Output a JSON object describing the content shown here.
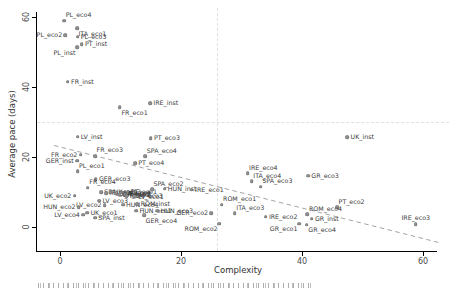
{
  "figure": {
    "reference_lines": {
      "horizontal_y": 30,
      "vertical_x": 25.9
    },
    "trend_line": {
      "x1": -1,
      "y1": 23.3,
      "x2": 63,
      "y2": -4.6
    },
    "colors": {
      "point": "#8f8f8f",
      "point_edge": "#6f6f6f",
      "trend_line": "#999999",
      "reference_line": "#e0e0e0",
      "axis": "#000000",
      "tick_label": "#4a4a4a",
      "point_label": "#3a3a3a"
    }
  },
  "chart_data": {
    "type": "scatter",
    "title": "",
    "xlabel": "Complexity",
    "ylabel": "Average pace (days)",
    "xlim": [
      -4,
      64
    ],
    "ylim": [
      -7,
      62
    ],
    "x_ticks": [
      0,
      20,
      40,
      60
    ],
    "y_ticks": [
      0,
      20,
      40,
      60
    ],
    "grid": "reference lines only (dashed at x=25.9, y=30)",
    "legend": "none",
    "trend": "dashed negative linear fit from (0,23) to (63,-4.6)",
    "points": [
      {
        "label": "PL_eco4",
        "x": 0.7,
        "y": 59.0,
        "side": "above-right"
      },
      {
        "label": "ITA_eco1",
        "x": 2.8,
        "y": 56.8,
        "side": "below-right"
      },
      {
        "label": "PL_eco2",
        "x": 0.9,
        "y": 54.8,
        "side": "left"
      },
      {
        "label": "PL_eco3",
        "x": 2.9,
        "y": 54.4,
        "side": "right"
      },
      {
        "label": "PT_inst",
        "x": 3.6,
        "y": 52.3,
        "side": "right"
      },
      {
        "label": "PL_inst",
        "x": 2.8,
        "y": 51.3,
        "side": "below-left"
      },
      {
        "label": "FR_inst",
        "x": 1.3,
        "y": 41.5,
        "side": "right"
      },
      {
        "label": "IRE_inst",
        "x": 14.9,
        "y": 35.4,
        "side": "right"
      },
      {
        "label": "FR_eco1",
        "x": 9.9,
        "y": 34.2,
        "side": "below-right"
      },
      {
        "label": "LV_inst",
        "x": 2.9,
        "y": 25.8,
        "side": "right"
      },
      {
        "label": "PT_eco3",
        "x": 15.0,
        "y": 25.4,
        "side": "right"
      },
      {
        "label": "UK_inst",
        "x": 47.5,
        "y": 25.6,
        "side": "right"
      },
      {
        "label": "FR_eco2",
        "x": 3.4,
        "y": 20.6,
        "side": "left"
      },
      {
        "label": "FR_eco3",
        "x": 5.8,
        "y": 20.3,
        "side": "above-right"
      },
      {
        "label": "GER_inst",
        "x": 2.8,
        "y": 19.0,
        "side": "left"
      },
      {
        "label": "PL_eco1",
        "x": 2.9,
        "y": 16.0,
        "side": "above-right"
      },
      {
        "label": "GER_eco3",
        "x": 5.9,
        "y": 13.6,
        "side": "right"
      },
      {
        "label": "SPA_eco4",
        "x": 14.1,
        "y": 20.2,
        "side": "above-right"
      },
      {
        "label": "PT_eco4",
        "x": 12.4,
        "y": 18.2,
        "side": "right"
      },
      {
        "label": "FR_eco4",
        "x": 4.6,
        "y": 11.2,
        "side": "above-right"
      },
      {
        "label": "UK_eco2",
        "x": 2.4,
        "y": 8.9,
        "side": "left"
      },
      {
        "label": "SPA_eco1",
        "x": 6.8,
        "y": 9.9,
        "side": "right"
      },
      {
        "label": "ITA_eco2",
        "x": 7.6,
        "y": 9.6,
        "side": "right"
      },
      {
        "label": "UK_eco3",
        "x": 8.4,
        "y": 9.9,
        "side": "right"
      },
      {
        "label": "GER_eco1",
        "x": 9.2,
        "y": 9.5,
        "side": "right"
      },
      {
        "label": "UK_eco4",
        "x": 10.0,
        "y": 9.8,
        "side": "right"
      },
      {
        "label": "ITA_inst",
        "x": 10.6,
        "y": 9.4,
        "side": "right"
      },
      {
        "label": "PT_eco1",
        "x": 11.2,
        "y": 9.9,
        "side": "right"
      },
      {
        "label": "GR_eco2",
        "x": 9.8,
        "y": 9.2,
        "side": "right"
      },
      {
        "label": "ROM_eco3",
        "x": 11.0,
        "y": 8.8,
        "side": "right"
      },
      {
        "label": "LV_eco3",
        "x": 6.5,
        "y": 7.5,
        "side": "right"
      },
      {
        "label": "SPA_eco2",
        "x": 15.2,
        "y": 10.8,
        "side": "above-right"
      },
      {
        "label": "HUN_inst",
        "x": 17.3,
        "y": 10.9,
        "side": "right"
      },
      {
        "label": "IRE_eco1",
        "x": 21.8,
        "y": 10.6,
        "side": "right"
      },
      {
        "label": "LV_eco2",
        "x": 7.4,
        "y": 6.2,
        "side": "left"
      },
      {
        "label": "HUN_eco4",
        "x": 10.4,
        "y": 6.4,
        "side": "right"
      },
      {
        "label": "LV_eco1",
        "x": 12.4,
        "y": 8.6,
        "side": "right"
      },
      {
        "label": "ROM_inst",
        "x": 12.8,
        "y": 6.5,
        "side": "right"
      },
      {
        "label": "HUN_eco2",
        "x": 3.1,
        "y": 5.7,
        "side": "left"
      },
      {
        "label": "LV_eco4",
        "x": 3.8,
        "y": 3.5,
        "side": "left"
      },
      {
        "label": "UK_eco1",
        "x": 4.5,
        "y": 4.1,
        "side": "right"
      },
      {
        "label": "SPA_inst",
        "x": 5.8,
        "y": 2.6,
        "side": "right"
      },
      {
        "label": "HUN_eco1",
        "x": 12.6,
        "y": 4.6,
        "side": "right"
      },
      {
        "label": "HUN_eco3",
        "x": 16.1,
        "y": 4.7,
        "side": "right"
      },
      {
        "label": "GER_eco4",
        "x": 13.9,
        "y": 3.4,
        "side": "below-right"
      },
      {
        "label": "IRE_eco4",
        "x": 31.0,
        "y": 15.3,
        "side": "above-right"
      },
      {
        "label": "ITA_eco4",
        "x": 31.7,
        "y": 13.1,
        "side": "above-right"
      },
      {
        "label": "SPA_eco3",
        "x": 33.2,
        "y": 11.5,
        "side": "above-right"
      },
      {
        "label": "GR_eco3",
        "x": 41.0,
        "y": 14.7,
        "side": "right"
      },
      {
        "label": "ROM_eco1",
        "x": 26.7,
        "y": 6.4,
        "side": "above-right"
      },
      {
        "label": "GER_eco2",
        "x": 25.0,
        "y": 4.0,
        "side": "left"
      },
      {
        "label": "ITA_eco3",
        "x": 28.9,
        "y": 3.9,
        "side": "above-right"
      },
      {
        "label": "IRE_eco2",
        "x": 34.0,
        "y": 2.9,
        "side": "right"
      },
      {
        "label": "ROM_eco2",
        "x": 26.3,
        "y": 1.0,
        "side": "below-left"
      },
      {
        "label": "PT_eco2",
        "x": 45.8,
        "y": 5.6,
        "side": "above-right"
      },
      {
        "label": "ROM_eco4",
        "x": 40.9,
        "y": 3.7,
        "side": "above-right"
      },
      {
        "label": "GR_inst",
        "x": 41.6,
        "y": 2.4,
        "side": "right"
      },
      {
        "label": "GR_eco1",
        "x": 39.5,
        "y": 1.0,
        "side": "below-left"
      },
      {
        "label": "GR_eco4",
        "x": 40.8,
        "y": 0.6,
        "side": "below-right"
      },
      {
        "label": "IRE_eco3",
        "x": 58.8,
        "y": 0.8,
        "side": "above"
      }
    ]
  }
}
